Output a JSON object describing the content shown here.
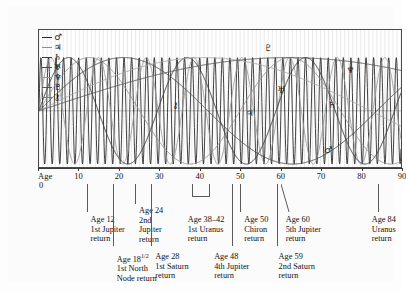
{
  "figure": {
    "kind": "planetary-cycles-life-chart",
    "axis_label": "Age",
    "axis_origin_label": "0"
  },
  "legend": {
    "items": [
      {
        "name": "mars",
        "symbol": "♂",
        "color": "#2b2b2b"
      },
      {
        "name": "jupiter",
        "symbol": "♃",
        "color": "#8e8e8e"
      },
      {
        "name": "saturn",
        "symbol": "♄",
        "color": "#3d3d3d"
      },
      {
        "name": "uranus",
        "symbol": "♅",
        "color": "#4a4a4a"
      },
      {
        "name": "neptune",
        "symbol": "♆",
        "color": "#9a9a9a"
      },
      {
        "name": "pluto",
        "symbol": "♇",
        "color": "#555555"
      },
      {
        "name": "chiron",
        "symbol": "⚷",
        "color": "#7a7a7a"
      }
    ]
  },
  "curve_labels": [
    {
      "name": "pluto-label",
      "symbol": "♇",
      "x": 63.0,
      "y": 13
    },
    {
      "name": "neptune-label",
      "symbol": "♆",
      "x": 85.5,
      "y": 29
    },
    {
      "name": "uranus-label",
      "symbol": "♅",
      "x": 66.5,
      "y": 43
    },
    {
      "name": "chiron-label",
      "symbol": "⚷",
      "x": 37.5,
      "y": 54
    },
    {
      "name": "jupiter-label",
      "symbol": "♃",
      "x": 58.0,
      "y": 60
    },
    {
      "name": "saturn-label",
      "symbol": "♄",
      "x": 80.5,
      "y": 54
    },
    {
      "name": "mars-label",
      "symbol": "♂",
      "x": 79.5,
      "y": 86
    }
  ],
  "chart_data": {
    "type": "line",
    "title": "",
    "xlabel": "Age",
    "ylabel": "",
    "xlim": [
      0,
      90
    ],
    "ylim": [
      -1,
      1
    ],
    "grid": true,
    "legend_position": "top-left-inside",
    "x_ticks": [
      0,
      10,
      20,
      30,
      40,
      50,
      60,
      70,
      80,
      90
    ],
    "x_tick_labels": [
      "0",
      "10",
      "20",
      "30",
      "40",
      "50",
      "60",
      "70",
      "80",
      "90"
    ],
    "series": [
      {
        "name": "Mars",
        "symbol": "♂",
        "period_years": 1.88,
        "color": "#2b2b2b",
        "width": 0.9
      },
      {
        "name": "Jupiter",
        "symbol": "♃",
        "period_years": 11.86,
        "color": "#9b9b9b",
        "width": 0.9
      },
      {
        "name": "Saturn",
        "symbol": "♄",
        "period_years": 29.46,
        "color": "#3d3d3d",
        "width": 1.0
      },
      {
        "name": "Chiron",
        "symbol": "⚷",
        "period_years": 50.0,
        "color": "#8c8c8c",
        "width": 0.9
      },
      {
        "name": "Uranus",
        "symbol": "♅",
        "period_years": 84.0,
        "color": "#4a4a4a",
        "width": 1.0
      },
      {
        "name": "Neptune",
        "symbol": "♆",
        "period_years": 164.8,
        "color": "#a5a5a5",
        "width": 1.0
      },
      {
        "name": "Pluto",
        "symbol": "♇",
        "period_years": 248.0,
        "color": "#555555",
        "width": 1.0
      }
    ]
  },
  "callouts_upper": [
    {
      "name": "callout-age-12",
      "age": 12,
      "marker": "line",
      "text": "Age 12\n1st Jupiter\nreturn"
    },
    {
      "name": "callout-age-24",
      "age": 24,
      "marker": "line",
      "text": "Age 24\n2nd\nJupiter\nreturn"
    },
    {
      "name": "callout-age-38-42",
      "age": 40,
      "age_range": [
        38,
        42
      ],
      "marker": "bracket",
      "text": "Age 38–42\n1st Uranus\nreturn"
    },
    {
      "name": "callout-age-50",
      "age": 50,
      "marker": "line",
      "text": "Age 50\nChiron\nreturn"
    },
    {
      "name": "callout-age-60",
      "age": 60,
      "marker": "diagonal",
      "text": "Age 60\n5th Jupiter\nreturn"
    },
    {
      "name": "callout-age-84",
      "age": 84,
      "marker": "line",
      "text": "Age 84\nUranus\nreturn"
    }
  ],
  "callouts_lower": [
    {
      "name": "callout-age-18-half",
      "age": 18.5,
      "marker": "line",
      "text_line1_pre": "Age 18",
      "text_line1_sup": "1/2",
      "text_rest": "1st North\nNode return"
    },
    {
      "name": "callout-age-28",
      "age": 28,
      "marker": "line",
      "text": "Age 28\n1st Saturn\nreturn"
    },
    {
      "name": "callout-age-48",
      "age": 48,
      "marker": "line",
      "text": "Age 48\n4th Jupiter\nreturn"
    },
    {
      "name": "callout-age-59",
      "age": 59,
      "marker": "line",
      "text": "Age 59\n2nd Saturn\nreturn"
    }
  ]
}
